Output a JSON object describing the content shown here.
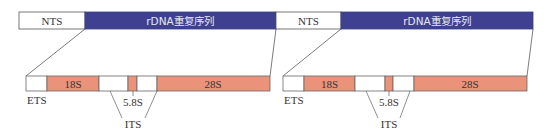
{
  "colors": {
    "rdna_fill": "#3f4190",
    "rrna_fill": "#ea937a",
    "spacer_fill": "#ffffff",
    "stroke": "#555555",
    "text": "#333333"
  },
  "top_bar": {
    "segments": [
      {
        "label": "NTS",
        "type": "nts"
      },
      {
        "label": "rDNA重复序列",
        "type": "rdna"
      },
      {
        "label": "NTS",
        "type": "nts"
      },
      {
        "label": "rDNA重复序列",
        "type": "rdna"
      }
    ]
  },
  "units": [
    {
      "segments": [
        {
          "label": "",
          "type": "spacer",
          "name": "ETS"
        },
        {
          "label": "18S",
          "type": "rrna"
        },
        {
          "label": "",
          "type": "spacer",
          "name": "ITS"
        },
        {
          "label": "",
          "type": "rrna",
          "name": "5.8S"
        },
        {
          "label": "",
          "type": "spacer",
          "name": "ITS"
        },
        {
          "label": "28S",
          "type": "rrna"
        }
      ],
      "labels": {
        "ets": "ETS",
        "s58": "5.8S",
        "its": "ITS"
      }
    },
    {
      "segments": [
        {
          "label": "",
          "type": "spacer",
          "name": "ETS"
        },
        {
          "label": "18S",
          "type": "rrna"
        },
        {
          "label": "",
          "type": "spacer",
          "name": "ITS"
        },
        {
          "label": "",
          "type": "rrna",
          "name": "5.8S"
        },
        {
          "label": "",
          "type": "spacer",
          "name": "ITS"
        },
        {
          "label": "28S",
          "type": "rrna"
        }
      ],
      "labels": {
        "ets": "ETS",
        "s58": "5.8S",
        "its": "ITS"
      }
    }
  ]
}
